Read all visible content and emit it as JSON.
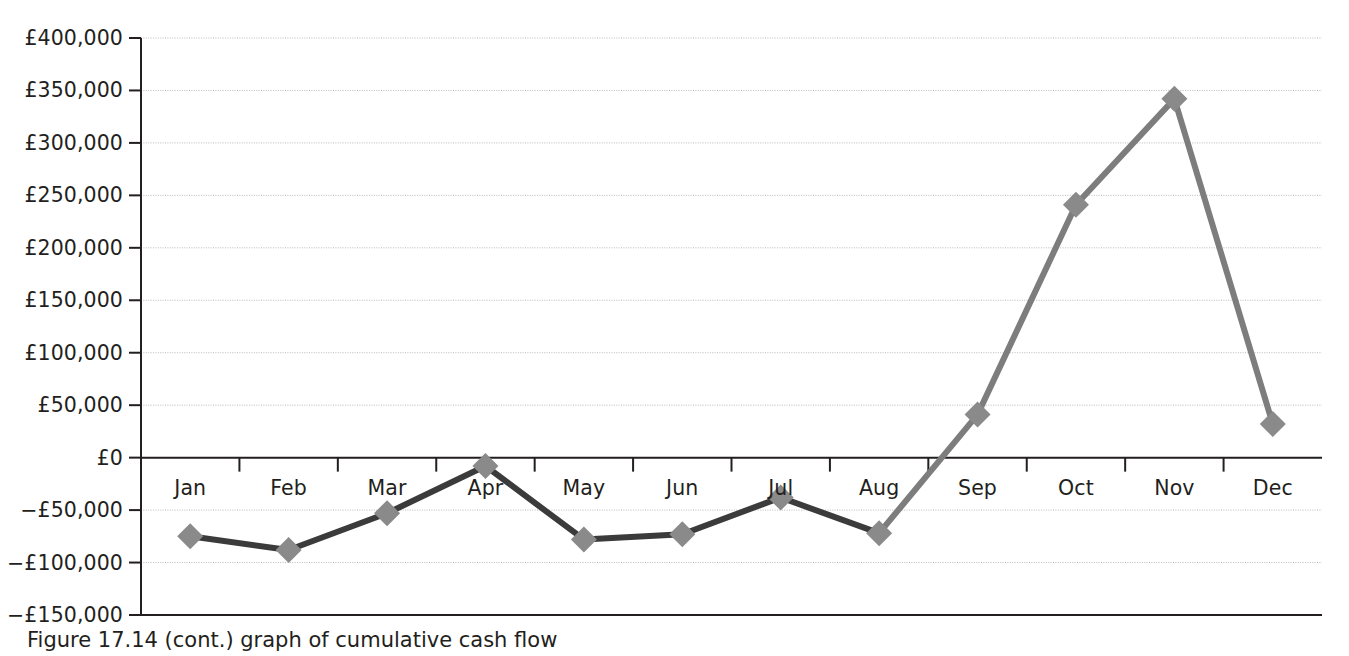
{
  "chart_data": {
    "type": "line",
    "title": "",
    "subtitle": "",
    "xlabel": "",
    "ylabel": "",
    "categories": [
      "Jan",
      "Feb",
      "Mar",
      "Apr",
      "May",
      "Jun",
      "Jul",
      "Aug",
      "Sep",
      "Oct",
      "Nov",
      "Dec"
    ],
    "series": [
      {
        "name": "Cumulative cash flow",
        "values": [
          -75000,
          -88000,
          -53000,
          -8000,
          -78000,
          -73000,
          -38000,
          -72000,
          41000,
          241000,
          342000,
          32000
        ]
      }
    ],
    "ylim": [
      -150000,
      400000
    ],
    "ytick_values": [
      400000,
      350000,
      300000,
      250000,
      200000,
      150000,
      100000,
      50000,
      0,
      -50000,
      -100000,
      -150000
    ],
    "ytick_labels": [
      "£400,000",
      "£350,000",
      "£300,000",
      "£250,000",
      "£200,000",
      "£150,000",
      "£100,000",
      "£50,000",
      "£0",
      "−£50,000",
      "−£100,000",
      "−£150,000"
    ],
    "grid": true,
    "grid_color": "#b9b9b9",
    "legend": false,
    "legend_position": "none",
    "marker": "diamond",
    "marker_color": "#8a8a8a",
    "line_color_negative": "#3b3b3b",
    "line_color_positive": "#7d7d7d",
    "axis_color": "#231f20",
    "annotations": []
  },
  "caption": {
    "text": "Figure 17.14 (cont.) graph of cumulative cash flow"
  }
}
